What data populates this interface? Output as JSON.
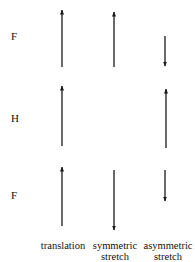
{
  "atoms": [
    {
      "label": "F",
      "y": 36
    },
    {
      "label": "H",
      "y": 118
    },
    {
      "label": "F",
      "y": 195
    }
  ],
  "modes": [
    {
      "label_line1": "translation",
      "label_line2": ""
    },
    {
      "label_line1": "symmetric",
      "label_line2": "stretch"
    },
    {
      "label_line1": "asymmetric",
      "label_line2": "stretch"
    }
  ],
  "arrows": [
    {
      "mode": "translation",
      "atom_row": 0,
      "direction": "up",
      "x": 62,
      "y1": 67,
      "y2": 10
    },
    {
      "mode": "symmetric",
      "atom_row": 0,
      "direction": "up",
      "x": 114,
      "y1": 67,
      "y2": 12
    },
    {
      "mode": "asymmetric",
      "atom_row": 0,
      "direction": "down",
      "x": 165,
      "y1": 36,
      "y2": 66
    },
    {
      "mode": "translation",
      "atom_row": 1,
      "direction": "up",
      "x": 62,
      "y1": 146,
      "y2": 86
    },
    {
      "mode": "asymmetric",
      "atom_row": 1,
      "direction": "up",
      "x": 166,
      "y1": 148,
      "y2": 89
    },
    {
      "mode": "translation",
      "atom_row": 2,
      "direction": "up",
      "x": 62,
      "y1": 226,
      "y2": 167
    },
    {
      "mode": "symmetric",
      "atom_row": 2,
      "direction": "down",
      "x": 114,
      "y1": 170,
      "y2": 230
    },
    {
      "mode": "asymmetric",
      "atom_row": 2,
      "direction": "down",
      "x": 165,
      "y1": 170,
      "y2": 201
    }
  ],
  "colors": {
    "arrow": "#1a1a1a",
    "text": "#111111",
    "background": "#ffffff"
  }
}
